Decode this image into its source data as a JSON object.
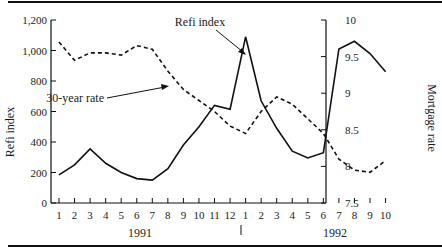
{
  "chart_data": {
    "type": "line",
    "title": "",
    "xlabel": "",
    "x": [
      "1",
      "2",
      "3",
      "4",
      "5",
      "6",
      "7",
      "8",
      "9",
      "10",
      "11",
      "12",
      "1",
      "2",
      "3",
      "4",
      "5",
      "6",
      "7",
      "8",
      "9",
      "10"
    ],
    "x_groups": [
      {
        "label": "1991",
        "months": [
          "1",
          "2",
          "3",
          "4",
          "5",
          "6",
          "7",
          "8",
          "9",
          "10",
          "11",
          "12"
        ]
      },
      {
        "label": "1992",
        "months": [
          "1",
          "2",
          "3",
          "4",
          "5",
          "6",
          "7",
          "8",
          "9",
          "10"
        ]
      }
    ],
    "y_left": {
      "label": "Refi index",
      "ticks": [
        "0",
        "200",
        "400",
        "600",
        "800",
        "1,000",
        "1,200"
      ],
      "ylim": [
        0,
        1200
      ]
    },
    "y_right": {
      "label": "Mortgage rate",
      "ticks": [
        "7.5",
        "8",
        "8.5",
        "9",
        "9.5",
        "10"
      ],
      "ylim": [
        7.5,
        10
      ]
    },
    "grid": false,
    "series": [
      {
        "name": "Refi index",
        "axis": "left",
        "style": "solid",
        "values": [
          185,
          250,
          355,
          260,
          200,
          160,
          150,
          225,
          380,
          500,
          640,
          615,
          1090,
          670,
          490,
          340,
          295,
          330,
          1010,
          1060,
          980,
          860
        ]
      },
      {
        "name": "30-year rate",
        "axis": "right",
        "style": "dashed",
        "values": [
          9.7,
          9.45,
          9.55,
          9.55,
          9.52,
          9.65,
          9.6,
          9.3,
          9.05,
          8.9,
          8.75,
          8.55,
          8.45,
          8.75,
          8.95,
          8.85,
          8.65,
          8.45,
          8.1,
          7.95,
          7.92,
          8.08
        ]
      }
    ],
    "annotations": [
      {
        "text": "Refi index",
        "points_to": "Refi index peak, month 1 of 1992"
      },
      {
        "text": "30-year rate",
        "points_to": "30-year rate line near month 8 of 1991"
      }
    ]
  },
  "labels": {
    "left_axis": "Refi index",
    "right_axis": "Mortgage rate",
    "year_1991": "1991",
    "year_1992": "1992",
    "annotation_refi": "Refi index",
    "annotation_rate": "30-year rate",
    "year_divider": "|"
  }
}
